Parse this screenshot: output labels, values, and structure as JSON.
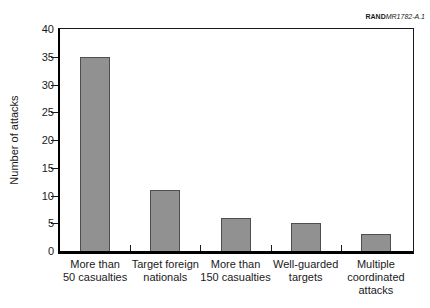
{
  "figure": {
    "source_prefix": "RAND",
    "source_id": "MR1782-A.1"
  },
  "chart_data": {
    "type": "bar",
    "title": "",
    "categories": [
      "More than\n50 casualties",
      "Target foreign\nnationals",
      "More than\n150 casualties",
      "Well-guarded\ntargets",
      "Multiple\ncoordinated\nattacks"
    ],
    "values": [
      35,
      11,
      6,
      5,
      3
    ],
    "xlabel": "",
    "ylabel": "Number of attacks",
    "ylim": [
      0,
      40
    ],
    "yticks": [
      0,
      5,
      10,
      15,
      20,
      25,
      30,
      35,
      40
    ],
    "grid": false,
    "legend": null,
    "colors": {
      "bar_fill": "#919191",
      "bar_border": "#4f4f4f",
      "axis": "#000000",
      "frame": "#1a1a1a",
      "text": "#1a1a1a"
    }
  }
}
